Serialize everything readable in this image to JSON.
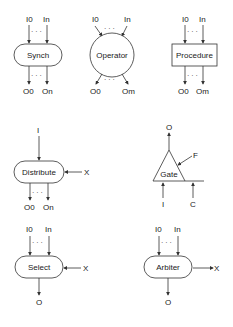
{
  "diagram": {
    "nodes": [
      {
        "id": "synch",
        "label": "Synch",
        "shape": "rounded-rect",
        "inputs": [
          "I0",
          "In"
        ],
        "outputs": [
          "O0",
          "On"
        ]
      },
      {
        "id": "operator",
        "label": "Operator",
        "shape": "circle",
        "inputs": [
          "I0",
          "In"
        ],
        "outputs": [
          "O0",
          "Om"
        ]
      },
      {
        "id": "procedure",
        "label": "Procedure",
        "shape": "rectangle",
        "inputs": [
          "I0",
          "In"
        ],
        "outputs": [
          "O0",
          "Om"
        ]
      },
      {
        "id": "distribute",
        "label": "Distribute",
        "shape": "rounded-rect",
        "inputs": [
          "I"
        ],
        "control": "X",
        "outputs": [
          "O0",
          "On"
        ]
      },
      {
        "id": "gate",
        "label": "Gate",
        "shape": "triangle",
        "inputs": [
          "I",
          "C"
        ],
        "control": "F",
        "outputs": [
          "O"
        ]
      },
      {
        "id": "select",
        "label": "Select",
        "shape": "rounded-rect",
        "inputs": [
          "I0",
          "In"
        ],
        "control": "X",
        "outputs": [
          "O"
        ]
      },
      {
        "id": "arbiter",
        "label": "Arbiter",
        "shape": "rounded-rect",
        "inputs": [
          "I0",
          "In"
        ],
        "control_out": "X",
        "outputs": [
          "O"
        ]
      }
    ],
    "ellipsis": "· · ·"
  }
}
